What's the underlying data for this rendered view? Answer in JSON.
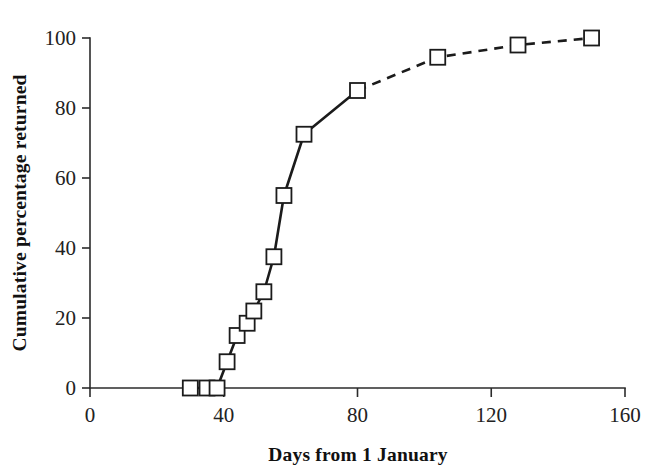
{
  "chart_data": {
    "type": "line",
    "title": "",
    "xlabel": "Days from 1 January",
    "ylabel": "Cumulative percentage returned",
    "xlim": [
      0,
      160
    ],
    "ylim": [
      0,
      100
    ],
    "xticks": [
      0,
      40,
      80,
      120,
      160
    ],
    "yticks": [
      0,
      20,
      40,
      60,
      80,
      100
    ],
    "xtick_labels": [
      "0",
      "40",
      "80",
      "120",
      "160"
    ],
    "ytick_labels": [
      "0",
      "20",
      "40",
      "60",
      "80",
      "100"
    ],
    "grid": false,
    "legend": "none",
    "marker": "open-square",
    "marker_face_color": "#ffffff",
    "marker_edge_color": "#1b1b1b",
    "line_color": "#1b1b1b",
    "series": [
      {
        "name": "Cumulative percentage returned",
        "x": [
          30,
          35,
          38,
          41,
          44,
          47,
          49,
          52,
          55,
          58,
          64,
          80,
          104,
          128,
          150
        ],
        "y": [
          0,
          0,
          0,
          7.5,
          15,
          18.5,
          22,
          27.5,
          37.5,
          55,
          72.5,
          85,
          94.5,
          98,
          100
        ],
        "solid_until_index": 11,
        "dashed_from_index": 11,
        "linestyle_solid": "solid",
        "linestyle_tail": "dashed"
      }
    ]
  },
  "axes": {
    "x_title": "Days from 1 January",
    "y_title": "Cumulative percentage returned"
  }
}
